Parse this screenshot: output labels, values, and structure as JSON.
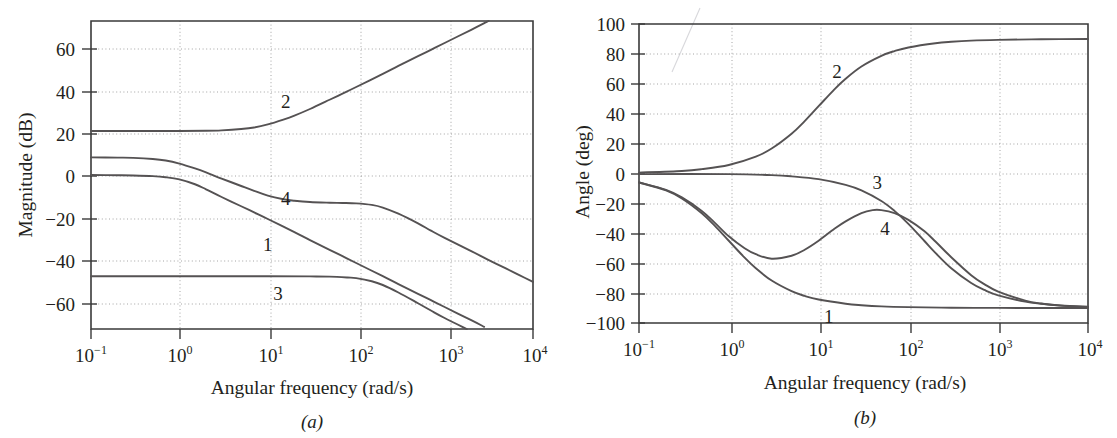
{
  "figure": {
    "panels": [
      {
        "id": "a",
        "panel_label": "(a)",
        "ylabel": "Magnitude (dB)",
        "xlabel": "Angular frequency (rad/s)"
      },
      {
        "id": "b",
        "panel_label": "(b)",
        "ylabel": "Angle (deg)",
        "xlabel": "Angular frequency (rad/s)"
      }
    ],
    "xtick_labels": [
      {
        "base": "10",
        "exp": "−1"
      },
      {
        "base": "10",
        "exp": "0"
      },
      {
        "base": "10",
        "exp": "1"
      },
      {
        "base": "10",
        "exp": "2"
      },
      {
        "base": "10",
        "exp": "3"
      },
      {
        "base": "10",
        "exp": "4"
      }
    ],
    "mag_ytick_labels": [
      "60",
      "40",
      "20",
      "0",
      "−20",
      "−40",
      "−60"
    ],
    "phase_ytick_labels": [
      "100",
      "80",
      "60",
      "40",
      "20",
      "0",
      "−20",
      "−40",
      "−60",
      "−80",
      "−100"
    ],
    "curve_labels": [
      "1",
      "2",
      "3",
      "4"
    ],
    "colors": {
      "curve": "#555253",
      "axis": "#3a3a3a",
      "grid": "#9a9a9a",
      "text": "#231f20",
      "background": "#ffffff"
    }
  },
  "chart_data": [
    {
      "type": "line",
      "title": "",
      "panel": "(a)",
      "xlabel": "Angular frequency (rad/s)",
      "ylabel": "Magnitude (dB)",
      "xscale": "log",
      "xlim": [
        0.1,
        10000
      ],
      "ylim": [
        -70,
        70
      ],
      "xticks": [
        0.1,
        1,
        10,
        100,
        1000,
        10000
      ],
      "yticks": [
        60,
        40,
        20,
        0,
        -20,
        -40,
        -60
      ],
      "grid": true,
      "legend": "inline-curve-numbers",
      "series": [
        {
          "name": "1",
          "label_at": {
            "x": 10,
            "y": -32
          },
          "x": [
            0.1,
            0.2,
            0.3,
            0.5,
            0.7,
            1,
            1.5,
            2,
            3,
            5,
            7,
            10,
            20,
            30,
            50,
            70,
            100,
            200,
            300,
            500,
            700,
            1000,
            2000,
            2800
          ],
          "y": [
            0.0,
            -0.1,
            -0.2,
            -0.5,
            -1.0,
            -2.0,
            -4.2,
            -6.5,
            -10.0,
            -14.2,
            -17.0,
            -20.0,
            -26.0,
            -29.6,
            -34.0,
            -36.9,
            -40.0,
            -46.0,
            -49.6,
            -54.0,
            -56.9,
            -60.0,
            -66.0,
            -69.0
          ]
        },
        {
          "name": "2",
          "label_at": {
            "x": 16,
            "y": 33
          },
          "x": [
            0.1,
            0.3,
            1,
            2,
            3,
            5,
            7,
            10,
            15,
            20,
            30,
            50,
            70,
            100,
            200,
            300,
            500,
            700,
            1000,
            2000,
            3000,
            5000,
            7000,
            10000
          ],
          "y": [
            20.0,
            20.0,
            20.0,
            20.1,
            20.3,
            20.9,
            21.6,
            23.0,
            25.2,
            27.0,
            30.0,
            34.2,
            37.0,
            40.0,
            46.0,
            49.6,
            54.0,
            56.9,
            60.0,
            66.0,
            69.6,
            74.0,
            76.9,
            80.0
          ]
        },
        {
          "name": "3",
          "label_at": {
            "x": 13,
            "y": -54
          },
          "x": [
            0.1,
            1,
            10,
            30,
            50,
            80,
            100,
            150,
            200,
            300,
            500,
            700,
            1000,
            2000,
            3000,
            5000,
            7000,
            10000
          ],
          "y": [
            -46.0,
            -46.0,
            -46.0,
            -46.1,
            -46.2,
            -46.6,
            -46.9,
            -48.3,
            -50.0,
            -53.4,
            -58.3,
            -61.6,
            -65.0,
            -71.0,
            -74.6,
            -79.0,
            -81.9,
            -85.0
          ]
        },
        {
          "name": "4",
          "label_at": {
            "x": 16,
            "y": -11
          },
          "x": [
            0.1,
            0.2,
            0.3,
            0.5,
            0.7,
            1,
            1.5,
            2,
            3,
            5,
            7,
            10,
            15,
            20,
            30,
            50,
            70,
            100,
            150,
            200,
            300,
            500,
            700,
            1000,
            2000,
            3000,
            5000,
            7000,
            10000
          ],
          "y": [
            8.0,
            7.9,
            7.8,
            7.3,
            6.6,
            5.2,
            3.0,
            1.2,
            -1.6,
            -5.0,
            -7.2,
            -9.4,
            -11.0,
            -11.7,
            -12.3,
            -12.6,
            -12.7,
            -12.9,
            -13.6,
            -14.8,
            -17.6,
            -22.0,
            -25.3,
            -28.6,
            -34.6,
            -38.2,
            -42.6,
            -45.5,
            -48.6
          ]
        }
      ]
    },
    {
      "type": "line",
      "title": "",
      "panel": "(b)",
      "xlabel": "Angular frequency (rad/s)",
      "ylabel": "Angle (deg)",
      "xscale": "log",
      "xlim": [
        0.1,
        10000
      ],
      "ylim": [
        -100,
        100
      ],
      "xticks": [
        0.1,
        1,
        10,
        100,
        1000,
        10000
      ],
      "yticks": [
        100,
        80,
        60,
        40,
        20,
        0,
        -20,
        -40,
        -60,
        -80,
        -100
      ],
      "grid": true,
      "legend": "inline-curve-numbers",
      "series": [
        {
          "name": "1",
          "label_at": {
            "x": 13,
            "y": -96
          },
          "x": [
            0.1,
            0.2,
            0.3,
            0.5,
            0.7,
            1,
            1.5,
            2,
            3,
            5,
            7,
            10,
            20,
            30,
            50,
            100,
            300,
            1000,
            3000,
            10000
          ],
          "y": [
            -6.0,
            -11.3,
            -16.7,
            -26.6,
            -35.0,
            -45.0,
            -56.3,
            -63.4,
            -71.6,
            -78.7,
            -81.9,
            -84.3,
            -87.1,
            -88.1,
            -88.9,
            -89.4,
            -89.8,
            -89.9,
            -90.0,
            -90.0
          ]
        },
        {
          "name": "2",
          "label_at": {
            "x": 16,
            "y": 68
          },
          "x": [
            0.1,
            0.3,
            0.5,
            1,
            2,
            3,
            5,
            7,
            10,
            15,
            20,
            30,
            50,
            70,
            100,
            200,
            300,
            500,
            1000,
            3000,
            10000
          ],
          "y": [
            0.6,
            1.7,
            2.9,
            5.7,
            11.3,
            16.7,
            26.6,
            35.0,
            45.0,
            56.3,
            63.4,
            71.6,
            78.7,
            81.9,
            84.3,
            87.1,
            88.1,
            88.9,
            89.4,
            89.8,
            90.0
          ]
        },
        {
          "name": "3",
          "label_at": {
            "x": 45,
            "y": -6
          },
          "x": [
            0.1,
            1,
            3,
            5,
            10,
            20,
            30,
            50,
            70,
            100,
            150,
            200,
            300,
            500,
            700,
            1000,
            2000,
            3000,
            5000,
            10000
          ],
          "y": [
            -0.4,
            -0.4,
            -1.1,
            -1.9,
            -3.8,
            -7.6,
            -11.3,
            -18.4,
            -25.0,
            -33.7,
            -45.0,
            -53.1,
            -63.4,
            -73.3,
            -77.9,
            -81.5,
            -85.7,
            -87.1,
            -88.3,
            -89.1
          ]
        },
        {
          "name": "4",
          "label_at": {
            "x": 55,
            "y": -37
          },
          "x": [
            0.1,
            0.2,
            0.3,
            0.5,
            0.7,
            1,
            1.5,
            2,
            3,
            5,
            7,
            10,
            15,
            20,
            30,
            40,
            50,
            70,
            100,
            150,
            200,
            300,
            500,
            700,
            1000,
            2000,
            3000,
            5000,
            10000
          ],
          "y": [
            -6.0,
            -11.0,
            -16.0,
            -25.0,
            -33.0,
            -42.0,
            -50.0,
            -54.0,
            -57.0,
            -55.0,
            -51.0,
            -45.0,
            -37.0,
            -32.0,
            -26.5,
            -24.5,
            -24.5,
            -26.5,
            -31.0,
            -38.5,
            -45.5,
            -56.0,
            -68.0,
            -74.0,
            -79.0,
            -85.0,
            -87.0,
            -88.4,
            -89.4
          ]
        }
      ]
    }
  ]
}
